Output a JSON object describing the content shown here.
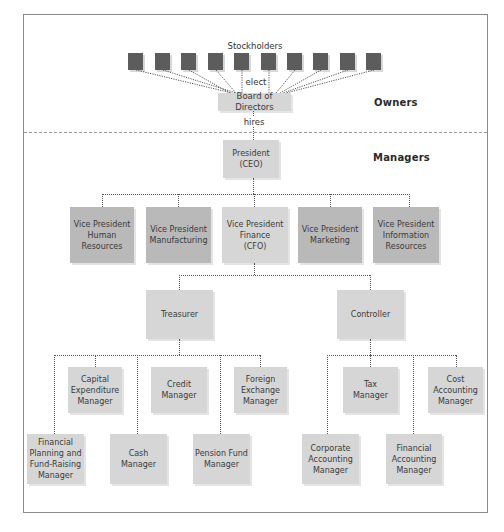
{
  "diagram": {
    "type": "org-chart",
    "sections": {
      "owners": "Owners",
      "managers": "Managers"
    },
    "stockholders": {
      "label": "Stockholders",
      "count": 10
    },
    "edges_labels": {
      "elect": "elect",
      "hires": "hires"
    },
    "board": "Board of Directors",
    "president": [
      "President",
      "(CEO)"
    ],
    "vice_presidents": [
      {
        "lines": [
          "Vice President",
          "Human",
          "Resources"
        ]
      },
      {
        "lines": [
          "Vice President",
          "Manufacturing"
        ]
      },
      {
        "lines": [
          "Vice President",
          "Finance",
          "(CFO)"
        ]
      },
      {
        "lines": [
          "Vice President",
          "Marketing"
        ]
      },
      {
        "lines": [
          "Vice President",
          "Information",
          "Resources"
        ]
      }
    ],
    "finance": {
      "treasurer": "Treasurer",
      "controller": "Controller"
    },
    "treasurer_reports": [
      {
        "lines": [
          "Capital",
          "Expenditure",
          "Manager"
        ]
      },
      {
        "lines": [
          "Credit",
          "Manager"
        ]
      },
      {
        "lines": [
          "Foreign",
          "Exchange",
          "Manager"
        ]
      },
      {
        "lines": [
          "Financial",
          "Planning and",
          "Fund-Raising",
          "Manager"
        ]
      },
      {
        "lines": [
          "Cash",
          "Manager"
        ]
      },
      {
        "lines": [
          "Pension Fund",
          "Manager"
        ]
      }
    ],
    "controller_reports": [
      {
        "lines": [
          "Tax",
          "Manager"
        ]
      },
      {
        "lines": [
          "Cost",
          "Accounting",
          "Manager"
        ]
      },
      {
        "lines": [
          "Corporate",
          "Accounting",
          "Manager"
        ]
      },
      {
        "lines": [
          "Financial",
          "Accounting",
          "Manager"
        ]
      }
    ],
    "colors": {
      "stockholder_box": "#5c5c5c",
      "vp_box": "#b9b9b9",
      "manager_box": "#d6d6d6",
      "frame": "#8a8a8a"
    }
  }
}
